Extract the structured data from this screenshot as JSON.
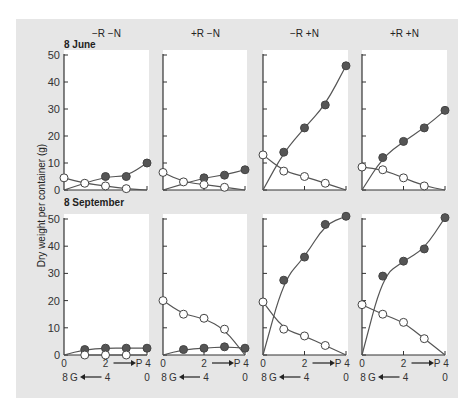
{
  "figure": {
    "ylabel": "Dry weight per container (g)",
    "column_headers": [
      "−R −N",
      "+R −N",
      "−R +N",
      "+R +N"
    ],
    "row_labels": [
      "8 June",
      "8 September"
    ],
    "x_axis_top_row": {
      "ticks": [
        "0",
        "2",
        "4"
      ],
      "label": "P",
      "arrow": "right"
    },
    "x_axis_bottom_row": {
      "ticks": [
        "8",
        "4",
        "0"
      ],
      "label": "G",
      "arrow": "left"
    },
    "y_ticks": [
      "0",
      "10",
      "20",
      "30",
      "40",
      "50"
    ],
    "legend_implicit": {
      "filled": "P (filled circles)",
      "open": "G (open circles)"
    },
    "colors": {
      "background": "#e6e6e6",
      "plot": "#ffffff",
      "line": "#555555",
      "filled_marker": "#555555",
      "open_marker": "#ffffff"
    }
  },
  "chart_data": [
    {
      "type": "scatter",
      "title": "8 June, −R −N",
      "xlabel": "P (0→4) / G (8→0)",
      "ylabel": "Dry weight per container (g)",
      "ylim": [
        0,
        50
      ],
      "x": [
        0,
        1,
        2,
        3,
        4
      ],
      "series": [
        {
          "name": "P (filled)",
          "x": [
            2,
            3,
            4
          ],
          "values": [
            5,
            5,
            10
          ]
        },
        {
          "name": "G (open)",
          "x": [
            0,
            1,
            2,
            3
          ],
          "values": [
            4.5,
            2.5,
            1.5,
            0.5
          ]
        }
      ]
    },
    {
      "type": "scatter",
      "title": "8 June, +R −N",
      "ylim": [
        0,
        50
      ],
      "series": [
        {
          "name": "P (filled)",
          "x": [
            2,
            3,
            4
          ],
          "values": [
            4.5,
            5.5,
            7.5
          ]
        },
        {
          "name": "G (open)",
          "x": [
            0,
            1,
            2,
            3
          ],
          "values": [
            6.5,
            3,
            2,
            1
          ]
        }
      ]
    },
    {
      "type": "scatter",
      "title": "8 June, −R +N",
      "ylim": [
        0,
        50
      ],
      "series": [
        {
          "name": "P (filled)",
          "x": [
            1,
            2,
            3,
            4
          ],
          "values": [
            14,
            23,
            31.5,
            46
          ]
        },
        {
          "name": "G (open)",
          "x": [
            0,
            1,
            2,
            3
          ],
          "values": [
            13,
            7,
            5,
            2.5
          ]
        }
      ]
    },
    {
      "type": "scatter",
      "title": "8 June, +R +N",
      "ylim": [
        0,
        50
      ],
      "series": [
        {
          "name": "P (filled)",
          "x": [
            1,
            2,
            3,
            4
          ],
          "values": [
            12,
            18,
            23,
            29.5
          ]
        },
        {
          "name": "G (open)",
          "x": [
            0,
            1,
            2,
            3
          ],
          "values": [
            8.5,
            7.5,
            4.5,
            1.5
          ]
        }
      ]
    },
    {
      "type": "scatter",
      "title": "8 September, −R −N",
      "ylim": [
        0,
        50
      ],
      "series": [
        {
          "name": "P (filled)",
          "x": [
            1,
            2,
            3,
            4
          ],
          "values": [
            2,
            2.5,
            2.5,
            2.5
          ]
        },
        {
          "name": "G (open)",
          "x": [
            1,
            2,
            3
          ],
          "values": [
            0,
            0,
            0
          ]
        }
      ]
    },
    {
      "type": "scatter",
      "title": "8 September, +R −N",
      "ylim": [
        0,
        50
      ],
      "series": [
        {
          "name": "P (filled)",
          "x": [
            1,
            2,
            3,
            4
          ],
          "values": [
            2,
            2.5,
            3,
            2.5
          ]
        },
        {
          "name": "G (open)",
          "x": [
            0,
            1,
            2,
            3
          ],
          "values": [
            20,
            15,
            13.5,
            9.5
          ]
        }
      ]
    },
    {
      "type": "scatter",
      "title": "8 September, −R +N",
      "ylim": [
        0,
        50
      ],
      "series": [
        {
          "name": "P (filled)",
          "x": [
            1,
            2,
            3,
            4
          ],
          "values": [
            27.5,
            36,
            48,
            51
          ]
        },
        {
          "name": "G (open)",
          "x": [
            0,
            1,
            2,
            3
          ],
          "values": [
            19.5,
            9.5,
            7,
            3.5
          ]
        }
      ]
    },
    {
      "type": "scatter",
      "title": "8 September, +R +N",
      "ylim": [
        0,
        50
      ],
      "series": [
        {
          "name": "P (filled)",
          "x": [
            1,
            2,
            3,
            4
          ],
          "values": [
            29,
            34.5,
            39,
            50.5
          ]
        },
        {
          "name": "G (open)",
          "x": [
            0,
            1,
            2,
            3
          ],
          "values": [
            18.5,
            15,
            12,
            6
          ]
        }
      ]
    }
  ]
}
